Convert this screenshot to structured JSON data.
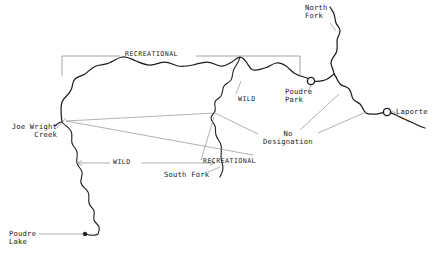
{
  "figure": {
    "name": "cache-la-poudre-river-classification-map",
    "width": 438,
    "height": 255,
    "background_color": "#ffffff",
    "ink_color": "#1d1d1d",
    "leader_color": "#8e8e8e"
  },
  "places": [
    {
      "id": "north-fork",
      "label": "North\nFork",
      "x": 305,
      "y": 6,
      "align": "left"
    },
    {
      "id": "poudre-park",
      "label": "Poudre\nPark",
      "x": 286,
      "y": 89,
      "align": "left"
    },
    {
      "id": "laporte",
      "label": "Laporte",
      "x": 396,
      "y": 109,
      "align": "left"
    },
    {
      "id": "joe-wright-creek",
      "label": "Joe Wright\nCreek",
      "x": 9,
      "y": 124,
      "align": "left"
    },
    {
      "id": "south-fork",
      "label": "South Fork",
      "x": 164,
      "y": 172,
      "align": "left"
    },
    {
      "id": "poudre-lake",
      "label": "Poudre\nLake",
      "x": 9,
      "y": 231,
      "align": "left"
    }
  ],
  "classifications": [
    {
      "id": "recreational-upper",
      "label": "RECREATIONAL",
      "x": 129,
      "y": 51
    },
    {
      "id": "wild-upper",
      "label": "WILD",
      "x": 238,
      "y": 96
    },
    {
      "id": "no-designation",
      "label": "No\nDesignation",
      "x": 258,
      "y": 131
    },
    {
      "id": "recreational-lower",
      "label": "RECREATIONAL",
      "x": 203,
      "y": 158
    },
    {
      "id": "wild-lower",
      "label": "WILD",
      "x": 115,
      "y": 158
    }
  ],
  "markers": [
    {
      "id": "poudre-park-marker",
      "shape": "circle",
      "x": 311,
      "y": 81,
      "r": 3.6
    },
    {
      "id": "laporte-marker",
      "shape": "circle",
      "x": 387,
      "y": 112,
      "r": 3.6
    },
    {
      "id": "poudre-lake-marker",
      "shape": "dot",
      "x": 85,
      "y": 234,
      "r": 1.9
    }
  ],
  "map_data": {
    "type": "reference-map",
    "subject": "Cache la Poudre River wild and scenic river classifications",
    "river_segments": [
      {
        "id": "main-stem",
        "name": "Cache la Poudre River main stem",
        "classification_west": "RECREATIONAL",
        "classification_east": "No Designation"
      },
      {
        "id": "north-fork-branch",
        "name": "North Fork",
        "classification": "No Designation"
      },
      {
        "id": "south-fork-branch",
        "name": "South Fork",
        "classification": "RECREATIONAL"
      },
      {
        "id": "upper-main",
        "name": "Upper main stem to Poudre Lake",
        "classification": "WILD"
      },
      {
        "id": "joe-wright-creek-branch",
        "name": "Joe Wright Creek",
        "classification": "WILD"
      }
    ]
  }
}
